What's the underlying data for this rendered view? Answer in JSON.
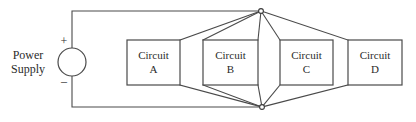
{
  "diagram": {
    "background_color": "#ffffff",
    "line_color": "#4a4a4a",
    "text_color": "#2b2b2b"
  },
  "power_supply": {
    "label_line1": "Power",
    "label_line2": "Supply",
    "positive_terminal": "+",
    "negative_terminal": "–",
    "symbol": "circle-source-symbol"
  },
  "circuits": [
    {
      "label_line1": "Circuit",
      "label_line2": "A",
      "name": "circuit-a"
    },
    {
      "label_line1": "Circuit",
      "label_line2": "B",
      "name": "circuit-b"
    },
    {
      "label_line1": "Circuit",
      "label_line2": "C",
      "name": "circuit-c"
    },
    {
      "label_line1": "Circuit",
      "label_line2": "D",
      "name": "circuit-d"
    }
  ],
  "nodes": {
    "top_junction": "top-junction-node",
    "bottom_junction": "bottom-junction-node"
  }
}
